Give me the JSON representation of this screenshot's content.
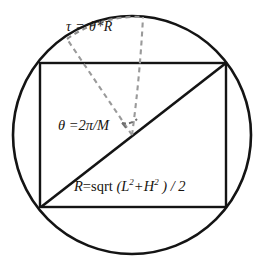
{
  "figure": {
    "colors": {
      "stroke": "#141414",
      "dashed": "#8a8a8a",
      "background": "#ffffff",
      "text": "#17140f"
    },
    "circle": {
      "center_x": 132,
      "center_y": 135,
      "radius": 119
    },
    "rectangle": {
      "left": 40,
      "top": 63,
      "right": 226,
      "bottom": 207,
      "width": 186,
      "height": 144
    },
    "diagonal": {
      "from_x": 41,
      "from_y": 207,
      "to_x": 226,
      "to_y": 63
    },
    "dashed_radius_left": {
      "from_x": 132,
      "from_y": 135,
      "to_x": 67,
      "to_y": 39
    },
    "dashed_radius_right": {
      "from_x": 132,
      "from_y": 135,
      "to_x": 143,
      "to_y": 17
    },
    "dashed_arc": {
      "from_x": 67,
      "from_y": 39,
      "to_x": 143,
      "to_y": 17
    },
    "angle_marker": {
      "center_x": 132,
      "center_y": 135,
      "radius": 15
    }
  },
  "labels": {
    "arc_length": {
      "full_text": "τ = θ*R",
      "tau": "τ",
      "equals": " = ",
      "expression": "θ*R"
    },
    "angle": {
      "full_text": "θ =2π/M",
      "theta": "θ",
      "equals": " =",
      "expression": "2π/M"
    },
    "radius_formula": {
      "full_text": "R=sqrt (L²+H² ) / 2",
      "r": "R",
      "equals": "=",
      "sqrt": "sqrt",
      "open_paren": " (",
      "l": "L",
      "l_exp": "2",
      "plus": "+",
      "h": "H",
      "h_exp": "2",
      "close_paren": " ) / 2"
    }
  }
}
